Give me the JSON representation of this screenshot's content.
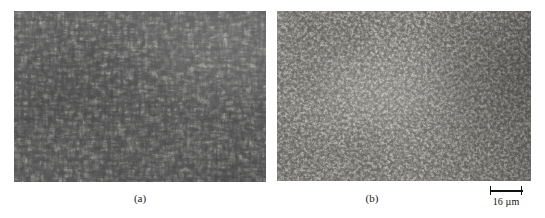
{
  "figure": {
    "background_color": "#ffffff",
    "type": "side-by-side optical micrographs of etched metallographic microstructures"
  },
  "panels": [
    {
      "id": "a",
      "caption": "(a)",
      "description": "coarse elongated acicular / lath-like dark constituent in a lighter matrix",
      "base_color": "#9c9c9c",
      "feature_color": "#6f6f6f"
    },
    {
      "id": "b",
      "caption": "(b)",
      "description": "fine equiaxed granular dark constituent in a lighter matrix",
      "base_color": "#b4b2ad",
      "feature_color": "#7d7a75"
    }
  ],
  "scale_bar": {
    "label": "16 µm",
    "value": 16,
    "unit": "µm",
    "color": "#111111"
  }
}
